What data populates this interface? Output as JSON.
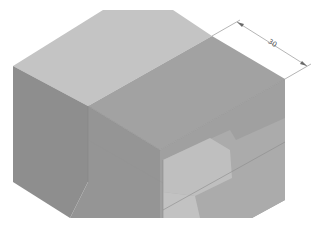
{
  "figure": {
    "colors": {
      "background": "#ffffff",
      "top_face": "#c4c4c4",
      "top_face_right": "#a2a2a2",
      "left_face": "#8e8e8e",
      "front_face": "#9d9d9d",
      "cut_inner_light": "#bdbdbd",
      "cut_inner_mid": "#b0b0b0",
      "cut_inner_dark": "#a8a8a8",
      "edge_line": "#8a8a8a",
      "dimension_line": "#6a6a6a"
    }
  },
  "dimension": {
    "label": "30",
    "orientation": "aligned-isometric"
  }
}
